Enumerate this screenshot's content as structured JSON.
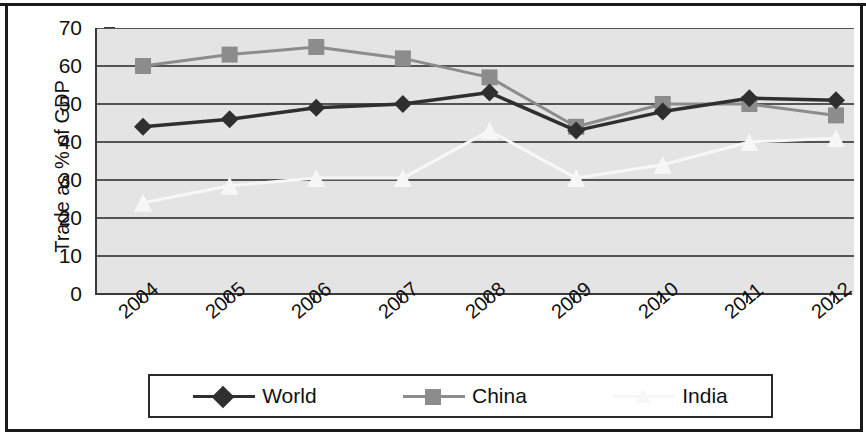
{
  "chart_data": {
    "type": "line",
    "title": "",
    "xlabel": "",
    "ylabel": "Trade as % of GDP",
    "categories": [
      "2004",
      "2005",
      "2006",
      "2007",
      "2008",
      "2009",
      "2010",
      "2011",
      "2012"
    ],
    "ylim": [
      0,
      70
    ],
    "ytick_labels": [
      "0",
      "10",
      "20",
      "30",
      "40",
      "50",
      "60",
      "70"
    ],
    "ytick_values": [
      0,
      10,
      20,
      30,
      40,
      50,
      60,
      70
    ],
    "grid": true,
    "grid_axis": "y",
    "legend_position": "bottom",
    "plot_background": "#e4e4e4",
    "series": [
      {
        "name": "World",
        "color": "#2f2f2f",
        "marker": "diamond",
        "values": [
          44,
          46,
          49,
          50,
          53,
          43,
          48,
          51.5,
          51
        ]
      },
      {
        "name": "China",
        "color": "#8c8c8c",
        "marker": "square",
        "values": [
          60,
          63,
          65,
          62,
          57,
          44,
          50,
          50,
          47
        ]
      },
      {
        "name": "India",
        "color": "#f7f7f7",
        "marker": "triangle",
        "values": [
          24,
          28.5,
          30.5,
          30.5,
          43,
          30.5,
          34,
          40,
          41
        ]
      }
    ]
  },
  "axis": {
    "y_title": "Trade as % of GDP"
  },
  "legend": {
    "entries": [
      {
        "label": "World"
      },
      {
        "label": "China"
      },
      {
        "label": "India"
      }
    ]
  }
}
